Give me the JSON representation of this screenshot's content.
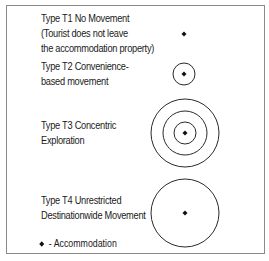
{
  "types": [
    {
      "id": "T1",
      "lines": [
        "Type T1 No Movement",
        "(Tourist does not leave",
        "the accommodation property)"
      ],
      "center": [
        184,
        34
      ],
      "radii": []
    },
    {
      "id": "T2",
      "lines": [
        "Type T2 Convenience-",
        "based movement"
      ],
      "center": [
        184,
        74
      ],
      "radii": [
        11
      ]
    },
    {
      "id": "T3",
      "lines": [
        "Type T3 Concentric",
        "Exploration"
      ],
      "center": [
        185,
        133
      ],
      "radii": [
        11,
        22,
        34
      ]
    },
    {
      "id": "T4",
      "lines": [
        "Type T4 Unrestricted",
        "Destinationwide Movement"
      ],
      "center": [
        185,
        213
      ],
      "radii": [
        34
      ]
    }
  ],
  "legend": {
    "symbol": "diamond",
    "label": "- Accommodation"
  },
  "colors": {
    "stroke": "#2a2a2a",
    "border": "#8a8a8a"
  }
}
